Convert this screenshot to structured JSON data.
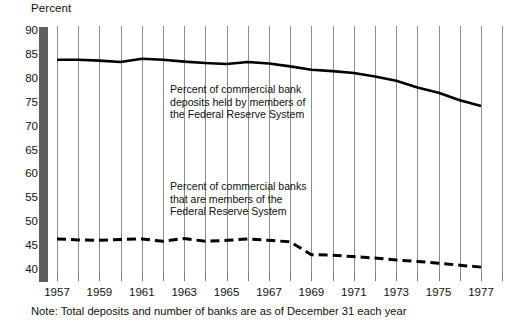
{
  "chart_data": {
    "type": "line",
    "title": "",
    "ylabel": "Percent",
    "xlabel": "",
    "ylim": [
      38.8,
      91.0
    ],
    "xlim": [
      1956.6,
      1978.2
    ],
    "grid": true,
    "legend_position": "inline-annotation",
    "ytick_labels": [
      "90",
      "85",
      "80",
      "75",
      "70",
      "65",
      "60",
      "55",
      "50",
      "45",
      "40"
    ],
    "ytick_values": [
      90,
      85,
      80,
      75,
      70,
      65,
      60,
      55,
      50,
      45,
      40
    ],
    "xtick_labels": [
      "1957",
      "1959",
      "1961",
      "1963",
      "1965",
      "1967",
      "1969",
      "1971",
      "1973",
      "1975",
      "1977"
    ],
    "xtick_values": [
      1957,
      1959,
      1961,
      1963,
      1965,
      1967,
      1969,
      1971,
      1973,
      1975,
      1977
    ],
    "x": [
      1957,
      1958,
      1959,
      1960,
      1961,
      1962,
      1963,
      1964,
      1965,
      1966,
      1967,
      1968,
      1969,
      1970,
      1971,
      1972,
      1973,
      1974,
      1975,
      1976,
      1977
    ],
    "series": [
      {
        "name": "Percent of commercial bank deposits held by members of the Federal Reserve System",
        "style": "solid",
        "values": [
          84.0,
          84.0,
          83.8,
          83.5,
          84.2,
          84.0,
          83.6,
          83.3,
          83.1,
          83.5,
          83.2,
          82.6,
          81.9,
          81.6,
          81.2,
          80.5,
          79.6,
          78.2,
          77.1,
          75.5,
          74.3
        ]
      },
      {
        "name": "Percent of commercial banks that are members of the Federal Reserve System",
        "style": "dashed",
        "values": [
          46.5,
          46.3,
          46.2,
          46.4,
          46.5,
          46.0,
          46.6,
          46.0,
          46.2,
          46.5,
          46.2,
          45.9,
          43.2,
          43.1,
          42.8,
          42.5,
          42.1,
          41.8,
          41.4,
          41.0,
          40.6
        ]
      }
    ],
    "annotations": [
      {
        "id": "deposits",
        "text": "Percent of commercial bank\ndeposits held by members of\nthe Federal Reserve System"
      },
      {
        "id": "banks",
        "text": "Percent of commercial banks\nthat are members of the\nFederal Reserve System"
      }
    ],
    "note": "Note:  Total deposits and number of banks are as of December 31 each year",
    "colors": {
      "line": "#000000",
      "gridline": "#8e8e8e",
      "axis_bar": "#5e5e5e",
      "text": "#111111",
      "background": "#ffffff"
    }
  }
}
